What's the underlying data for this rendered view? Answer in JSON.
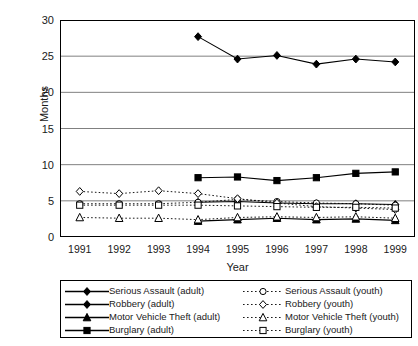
{
  "chart_data": {
    "type": "line",
    "title": "",
    "xlabel": "Year",
    "ylabel": "Months",
    "x": [
      1991,
      1992,
      1993,
      1994,
      1995,
      1996,
      1997,
      1998,
      1999
    ],
    "xlim": [
      1990.5,
      1999.5
    ],
    "ylim": [
      0,
      30
    ],
    "yticks": [
      0,
      5,
      10,
      15,
      20,
      25,
      30
    ],
    "grid": "horizontal",
    "legend_position": "bottom",
    "series": [
      {
        "name": "Serious Assault (adult)",
        "group": "adult",
        "marker": "filled-diamond",
        "line": "solid",
        "x": [
          1994,
          1995,
          1996,
          1997,
          1998,
          1999
        ],
        "values": [
          27.7,
          24.6,
          25.1,
          23.9,
          24.6,
          24.2
        ]
      },
      {
        "name": "Robbery (adult)",
        "group": "adult",
        "marker": "filled-diamond",
        "line": "solid",
        "x": [
          1994,
          1995,
          1996,
          1997,
          1998,
          1999
        ],
        "values": [
          4.8,
          4.9,
          4.7,
          4.6,
          4.6,
          4.5
        ]
      },
      {
        "name": "Motor Vehicle Theft (adult)",
        "group": "adult",
        "marker": "filled-triangle",
        "line": "solid",
        "x": [
          1994,
          1995,
          1996,
          1997,
          1998,
          1999
        ],
        "values": [
          2.2,
          2.4,
          2.6,
          2.4,
          2.5,
          2.3
        ]
      },
      {
        "name": "Burglary (adult)",
        "group": "adult",
        "marker": "filled-square",
        "line": "solid",
        "x": [
          1994,
          1995,
          1996,
          1997,
          1998,
          1999
        ],
        "values": [
          8.2,
          8.3,
          7.8,
          8.2,
          8.8,
          9.0
        ]
      },
      {
        "name": "Serious Assault (youth)",
        "group": "youth",
        "marker": "open-circle",
        "line": "dotted",
        "x": [
          1991,
          1992,
          1993,
          1994,
          1995,
          1996,
          1997,
          1998,
          1999
        ],
        "values": [
          4.6,
          4.6,
          4.6,
          4.8,
          5.2,
          4.9,
          4.7,
          4.6,
          4.4
        ]
      },
      {
        "name": "Robbery (youth)",
        "group": "youth",
        "marker": "open-diamond",
        "line": "dotted",
        "x": [
          1991,
          1992,
          1993,
          1994,
          1995,
          1996,
          1997,
          1998,
          1999
        ],
        "values": [
          6.3,
          6.0,
          6.4,
          6.0,
          5.3,
          4.7,
          4.2,
          4.0,
          3.8
        ]
      },
      {
        "name": "Motor Vehicle Theft (youth)",
        "group": "youth",
        "marker": "open-triangle",
        "line": "dotted",
        "x": [
          1991,
          1992,
          1993,
          1994,
          1995,
          1996,
          1997,
          1998,
          1999
        ],
        "values": [
          2.7,
          2.6,
          2.6,
          2.4,
          2.7,
          2.8,
          2.7,
          2.8,
          2.6
        ]
      },
      {
        "name": "Burglary (youth)",
        "group": "youth",
        "marker": "open-square",
        "line": "dotted",
        "x": [
          1991,
          1992,
          1993,
          1994,
          1995,
          1996,
          1997,
          1998,
          1999
        ],
        "values": [
          4.4,
          4.4,
          4.4,
          4.4,
          4.3,
          4.2,
          4.1,
          4.1,
          4.0
        ]
      }
    ]
  },
  "colors": {
    "line": "#000000",
    "grid": "#808080",
    "axis": "#000000",
    "background": "#ffffff"
  }
}
